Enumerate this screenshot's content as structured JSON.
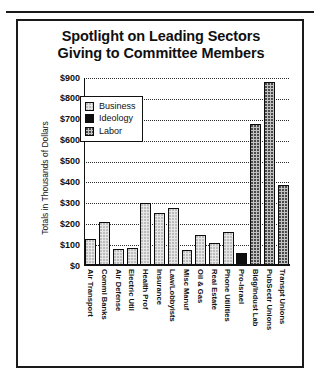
{
  "chart_data": {
    "type": "bar",
    "title": "Spotlight on Leading Sectors Giving to Committee Members",
    "title_lines": [
      "Spotlight on Leading Sectors",
      "Giving to Committee Members"
    ],
    "xlabel": "",
    "ylabel": "Totals in Thousands of Dollars",
    "ylim": [
      0,
      900
    ],
    "ytick_labels": [
      "$900",
      "$800",
      "$700",
      "$600",
      "$500",
      "$400",
      "$300",
      "$200",
      "$100",
      "$0"
    ],
    "ytick_values": [
      900,
      800,
      700,
      600,
      500,
      400,
      300,
      200,
      100,
      0
    ],
    "grid": true,
    "legend_position": "upper-center",
    "legend": [
      {
        "label": "Business",
        "pattern": "light-dotted",
        "color": "#e6e6e6"
      },
      {
        "label": "Ideology",
        "pattern": "solid-black",
        "color": "#0e0e0e"
      },
      {
        "label": "Labor",
        "pattern": "medium-dotted",
        "color": "#c3c3c3"
      }
    ],
    "categories": [
      "Air Transport",
      "Comml Banks",
      "Air Defense",
      "Electric Util",
      "Health Prof",
      "Insurance",
      "Law/Lobbyists",
      "Misc Manuf",
      "Oil & Gas",
      "Real Estate",
      "Phone Utilities",
      "Pro-Israel",
      "Bldg/Indust Lab",
      "PubSectr Unions",
      "Transpt Unions"
    ],
    "values": [
      130,
      210,
      80,
      85,
      300,
      255,
      280,
      75,
      150,
      110,
      165,
      60,
      680,
      880,
      390
    ],
    "groups": [
      "Business",
      "Business",
      "Business",
      "Business",
      "Business",
      "Business",
      "Business",
      "Business",
      "Business",
      "Business",
      "Business",
      "Ideology",
      "Labor",
      "Labor",
      "Labor"
    ]
  }
}
